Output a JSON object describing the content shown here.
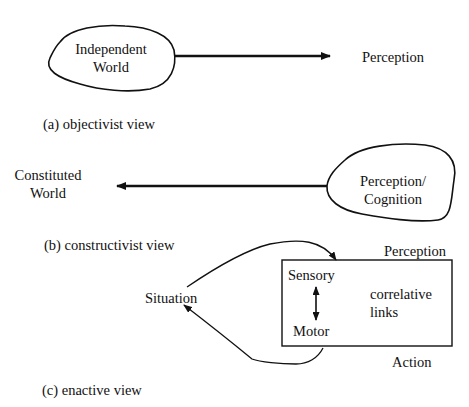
{
  "figure": {
    "panel_a": {
      "blob_label_line1": "Independent",
      "blob_label_line2": "World",
      "target_label": "Perception",
      "caption": "(a)  objectivist view"
    },
    "panel_b": {
      "target_label_line1": "Constituted",
      "target_label_line2": "World",
      "blob_label_line1": "Perception/",
      "blob_label_line2": "Cognition",
      "caption": "(b) constructivist view"
    },
    "panel_c": {
      "situation_label": "Situation",
      "perception_label": "Perception",
      "action_label": "Action",
      "box": {
        "sensory_label": "Sensory",
        "motor_label": "Motor",
        "links_line1": "correlative",
        "links_line2": "links"
      },
      "caption": "(c)  enactive view"
    }
  },
  "colors": {
    "stroke": "#111111",
    "background": "#ffffff"
  }
}
